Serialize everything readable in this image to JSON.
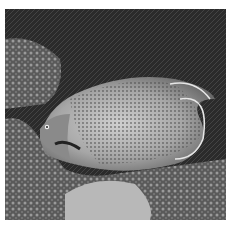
{
  "image": {
    "alt": "Grayscale photograph of a semicircle angelfish swimming over coral reef",
    "subject": "angelfish",
    "background": "coral reef",
    "colors": {
      "border": "#ffffff",
      "background_dark": "#2e2e2e",
      "fish_body": "#9a9a9a",
      "fish_highlight": "#c8c8c8",
      "coral_light": "#b0b0b0"
    }
  }
}
